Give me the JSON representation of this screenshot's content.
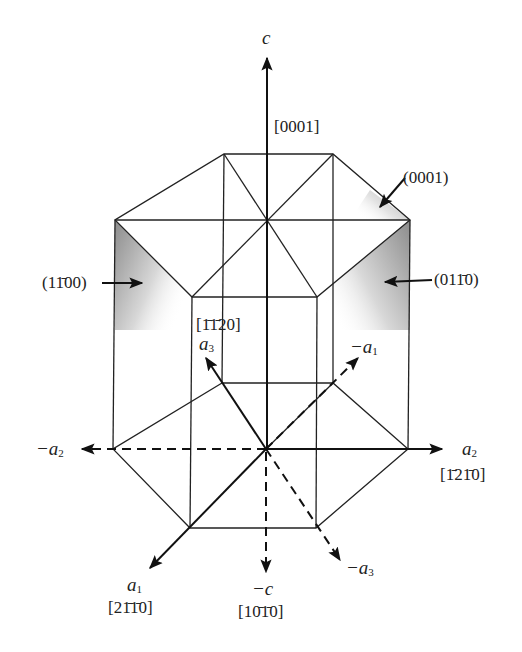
{
  "figure": {
    "axes": {
      "c": {
        "label": "c",
        "direction": "[0001]"
      },
      "minus_c": {
        "label": "−c",
        "direction": "[10̄1̄0]"
      },
      "a1": {
        "label": "a",
        "sub": "1",
        "direction": "[21̄1̄0]"
      },
      "minus_a1": {
        "label": "−a",
        "sub": "1"
      },
      "a2": {
        "label": "a",
        "sub": "2",
        "direction": "[1̄21̄0]"
      },
      "minus_a2": {
        "label": "−a",
        "sub": "2"
      },
      "a3": {
        "label": "a",
        "sub": "3",
        "direction": "[1̄1̄20]"
      },
      "minus_a3": {
        "label": "−a",
        "sub": "3"
      }
    },
    "planes": {
      "basal": "(0001)",
      "prism_left": "(11̄00)",
      "prism_right": "(011̄0)"
    },
    "colors": {
      "line": "#222222",
      "shade_dark": "#8c8c8c",
      "background": "#ffffff"
    }
  }
}
